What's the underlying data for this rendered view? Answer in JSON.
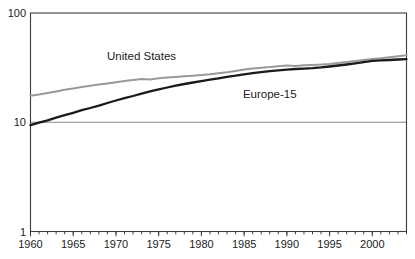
{
  "chart_data": {
    "type": "line",
    "title": "",
    "xlabel": "",
    "ylabel": "",
    "y_scale": "log",
    "ylim": [
      1,
      100
    ],
    "yticks": [
      1,
      10,
      100
    ],
    "gridlines_y": [
      10
    ],
    "xticks": [
      1960,
      1965,
      1970,
      1975,
      1980,
      1985,
      1990,
      1995,
      2000
    ],
    "x": [
      1960,
      1961,
      1962,
      1963,
      1964,
      1965,
      1966,
      1967,
      1968,
      1969,
      1970,
      1971,
      1972,
      1973,
      1974,
      1975,
      1976,
      1977,
      1978,
      1979,
      1980,
      1981,
      1982,
      1983,
      1984,
      1985,
      1986,
      1987,
      1988,
      1989,
      1990,
      1991,
      1992,
      1993,
      1994,
      1995,
      1996,
      1997,
      1998,
      1999,
      2000,
      2001,
      2002,
      2003,
      2004
    ],
    "series": [
      {
        "name": "United States",
        "color": "#999999",
        "line_width": 2,
        "values": [
          17.5,
          17.9,
          18.5,
          19.1,
          19.8,
          20.4,
          21.0,
          21.6,
          22.1,
          22.7,
          23.2,
          23.8,
          24.4,
          24.9,
          24.6,
          25.3,
          25.7,
          26.0,
          26.4,
          26.7,
          27.0,
          27.5,
          28.1,
          28.7,
          29.5,
          30.4,
          31.0,
          31.5,
          32.0,
          32.6,
          33.0,
          32.7,
          33.2,
          33.5,
          33.8,
          34.2,
          34.9,
          35.6,
          36.4,
          37.2,
          38.0,
          38.6,
          39.4,
          40.2,
          41.0
        ]
      },
      {
        "name": "Europe-15",
        "color": "#1a1a1a",
        "line_width": 2.3,
        "values": [
          9.4,
          9.9,
          10.4,
          11.0,
          11.6,
          12.2,
          12.9,
          13.5,
          14.2,
          15.0,
          15.8,
          16.6,
          17.4,
          18.3,
          19.2,
          20.0,
          20.8,
          21.6,
          22.4,
          23.1,
          23.8,
          24.5,
          25.2,
          26.0,
          26.7,
          27.5,
          28.1,
          28.7,
          29.3,
          29.8,
          30.3,
          30.7,
          31.0,
          31.3,
          31.8,
          32.4,
          33.1,
          33.8,
          34.6,
          35.5,
          36.4,
          36.8,
          37.1,
          37.5,
          37.8
        ]
      }
    ],
    "annotations": [
      {
        "text": "United States",
        "year": 1973,
        "value": 40
      },
      {
        "text": "Europe-15",
        "year": 1988,
        "value": 18
      }
    ],
    "legend": "none",
    "frame_color": "#3c3c3c",
    "grid_color": "#777777",
    "text_color": "#1c1c1c",
    "background_color": "#ffffff"
  }
}
